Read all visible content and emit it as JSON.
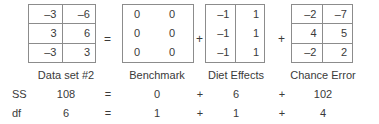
{
  "figure": {
    "kind": "anova-decomposition-diagram",
    "operators": {
      "equals": "=",
      "plus": "+"
    },
    "matrices": [
      {
        "name": "data-set-2",
        "label": "Data set #2",
        "grid": "full",
        "rows": [
          [
            "–3",
            "–6"
          ],
          [
            "3",
            "6"
          ],
          [
            "–3",
            "3"
          ]
        ]
      },
      {
        "name": "benchmark",
        "label": "Benchmark",
        "grid": "none",
        "rows": [
          [
            "0",
            "0"
          ],
          [
            "0",
            "0"
          ],
          [
            "0",
            "0"
          ]
        ]
      },
      {
        "name": "diet-effects",
        "label": "Diet Effects",
        "grid": "vertical",
        "rows": [
          [
            "–1",
            "1"
          ],
          [
            "–1",
            "1"
          ],
          [
            "–1",
            "1"
          ]
        ]
      },
      {
        "name": "chance-error",
        "label": "Chance Error",
        "grid": "full",
        "rows": [
          [
            "–2",
            "–7"
          ],
          [
            "4",
            "5"
          ],
          [
            "–2",
            "2"
          ]
        ]
      }
    ],
    "stats_rows": [
      {
        "name": "ss",
        "stat": "SS",
        "values": [
          "108",
          "0",
          "6",
          "102"
        ],
        "ops": [
          "=",
          "+",
          "+"
        ]
      },
      {
        "name": "df",
        "stat": "df",
        "values": [
          "6",
          "1",
          "1",
          "4"
        ],
        "ops": [
          "=",
          "+",
          "+"
        ]
      }
    ],
    "colors": {
      "text": "#3a3a3a",
      "border": "#8c8c8c",
      "background": "#ffffff"
    }
  }
}
